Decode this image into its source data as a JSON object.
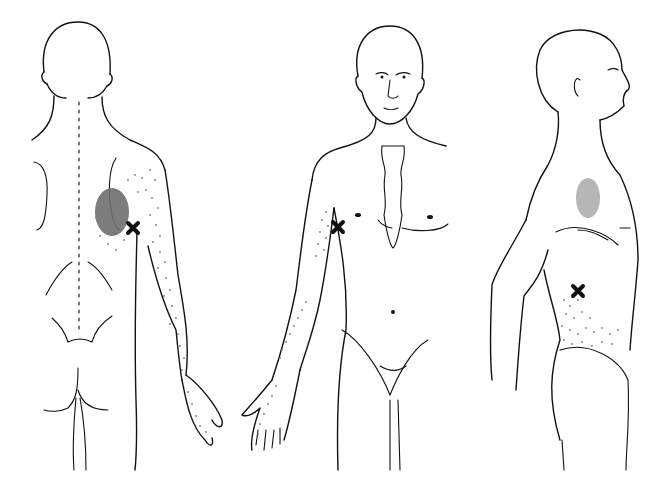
{
  "diagram": {
    "type": "trigger-point referral pattern illustration",
    "background": "#ffffff",
    "line_color": "#111111",
    "referral_dot_color": "#7a7a7a",
    "essential_zone_color": "#6e6e6e",
    "views": [
      {
        "id": "posterior",
        "label": "",
        "trigger_point": {
          "x": 133,
          "y": 228
        },
        "essential_zone": "medial to scapula inferior angle region",
        "spillover": "posterior arm, forearm, ulnar hand"
      },
      {
        "id": "anterior",
        "label": "",
        "trigger_point": {
          "x": 338,
          "y": 227
        },
        "spillover": "anterior arm, forearm, palm"
      },
      {
        "id": "lateral",
        "label": "",
        "trigger_point": {
          "x": 578,
          "y": 291
        },
        "essential_zone": "anterior shoulder/axilla",
        "spillover": "lower flank above hip"
      }
    ]
  }
}
